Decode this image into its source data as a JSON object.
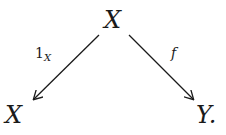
{
  "diagram": {
    "type": "commutative-triangle",
    "nodes": {
      "top": "X",
      "bottom_left": "X",
      "bottom_right": "Y."
    },
    "arrows": [
      {
        "from": "top",
        "to": "bottom_left",
        "label_main": "1",
        "label_sub": "X"
      },
      {
        "from": "top",
        "to": "bottom_right",
        "label_main": "f"
      }
    ],
    "colors": {
      "ink": "#1a1a1a",
      "background": "#ffffff"
    }
  }
}
